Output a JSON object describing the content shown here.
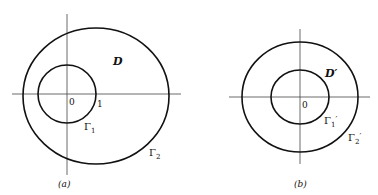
{
  "figure": {
    "panel_a": {
      "caption": "(a)",
      "region_label": "D",
      "origin_label": "0",
      "unit_label": "1",
      "inner_curve_label": "Γ",
      "inner_curve_sub": "1",
      "outer_curve_label": "Γ",
      "outer_curve_sub": "2"
    },
    "panel_b": {
      "caption": "(b)",
      "region_label": "D′",
      "origin_label": "0",
      "inner_curve_label": "Γ",
      "inner_curve_sub": "1",
      "inner_curve_prime": "′",
      "outer_curve_label": "Γ",
      "outer_curve_sub": "2",
      "outer_curve_prime": "′"
    },
    "colors": {
      "stroke": "#111111",
      "axis": "#333333",
      "background": "#ffffff"
    }
  }
}
